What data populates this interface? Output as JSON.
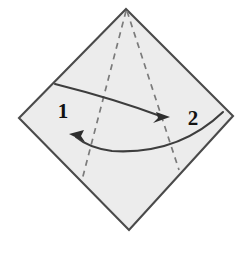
{
  "figure": {
    "type": "origami-instruction",
    "background_color": "#ffffff",
    "paper": {
      "name": "square-sheet-diamond-orientation",
      "fill_color": "#eaeaea",
      "edge_color": "#4a4a4a",
      "vertices": {
        "top": [
          126,
          9
        ],
        "right": [
          233,
          116
        ],
        "bottom": [
          129,
          230
        ],
        "left": [
          19,
          118
        ]
      }
    },
    "fold_lines": [
      {
        "name": "left-fold-crease",
        "style": "dashed",
        "color": "#777777",
        "from": [
          126,
          10
        ],
        "to": [
          82,
          180
        ]
      },
      {
        "name": "right-fold-crease",
        "style": "dashed",
        "color": "#777777",
        "from": [
          127,
          10
        ],
        "to": [
          179,
          170
        ]
      }
    ],
    "arrows": [
      {
        "name": "fold-arrow-1",
        "label": "1",
        "direction": "left-to-right",
        "color": "#3d3d3d",
        "start": [
          55,
          84
        ],
        "end": [
          169,
          117
        ],
        "label_position": [
          63,
          110
        ]
      },
      {
        "name": "fold-arrow-2",
        "label": "2",
        "direction": "right-to-left",
        "color": "#3d3d3d",
        "start": [
          223,
          112
        ],
        "end": [
          70,
          135
        ],
        "label_position": [
          193,
          118
        ]
      }
    ],
    "labels": {
      "step_one": "1",
      "step_two": "2"
    }
  }
}
